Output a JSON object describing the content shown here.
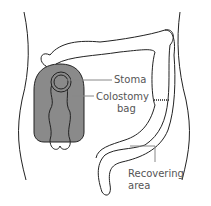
{
  "diagram": {
    "type": "medical illustration",
    "subject": "colostomy",
    "labels": {
      "stoma": "Stoma",
      "colostomy_bag_line1": "Colostomy",
      "colostomy_bag_line2": "bag",
      "recovering_line1": "Recovering",
      "recovering_line2": "area"
    },
    "colors": {
      "outline": "#222222",
      "bag_fill": "#8a8a8a",
      "leader_line": "#888888",
      "label_text": "#555555"
    }
  }
}
